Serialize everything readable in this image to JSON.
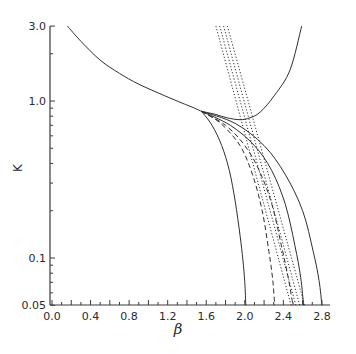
{
  "chart_data": {
    "type": "line",
    "title": "",
    "xlabel": "β",
    "ylabel": "K",
    "xlim": [
      0.0,
      2.9
    ],
    "ylim": [
      0.05,
      3.0
    ],
    "yscale": "log",
    "grid": false,
    "legend": null,
    "x_ticks": [
      "0.0",
      "0.4",
      "0.8",
      "1.2",
      "1.6",
      "2.0",
      "2.4",
      "2.8"
    ],
    "y_ticks": [
      "3.0",
      "1.0",
      "0.1",
      "0.05"
    ],
    "series": [
      {
        "name": "common-branch",
        "style": "solid",
        "x": [
          0.16,
          0.3,
          0.5,
          0.7,
          0.9,
          1.17,
          1.35,
          1.48,
          1.55
        ],
        "y": [
          3.0,
          2.4,
          1.82,
          1.5,
          1.28,
          1.08,
          0.97,
          0.9,
          0.86
        ]
      },
      {
        "name": "u-curve",
        "style": "solid",
        "x": [
          1.55,
          1.7,
          1.82,
          1.95,
          2.05,
          2.16,
          2.31,
          2.47,
          2.59
        ],
        "y": [
          0.86,
          0.82,
          0.78,
          0.76,
          0.78,
          0.85,
          1.09,
          1.58,
          3.0
        ]
      },
      {
        "name": "collapse-2.0",
        "style": "solid",
        "x": [
          1.55,
          1.66,
          1.76,
          1.84,
          1.9,
          1.95,
          1.98,
          2.0,
          2.01
        ],
        "y": [
          0.86,
          0.7,
          0.52,
          0.36,
          0.23,
          0.14,
          0.097,
          0.07,
          0.05
        ]
      },
      {
        "name": "dashed-2.3",
        "style": "dashed",
        "x": [
          1.55,
          1.75,
          1.95,
          2.08,
          2.18,
          2.25,
          2.29,
          2.31
        ],
        "y": [
          0.86,
          0.72,
          0.52,
          0.34,
          0.2,
          0.11,
          0.072,
          0.05
        ]
      },
      {
        "name": "dashed-2.5",
        "style": "dashed",
        "x": [
          1.55,
          1.8,
          2.0,
          2.15,
          2.28,
          2.38,
          2.45,
          2.5
        ],
        "y": [
          0.86,
          0.7,
          0.52,
          0.36,
          0.22,
          0.12,
          0.075,
          0.05
        ]
      },
      {
        "name": "solid-2.6",
        "style": "solid",
        "x": [
          1.55,
          1.85,
          2.1,
          2.28,
          2.42,
          2.52,
          2.58,
          2.61
        ],
        "y": [
          0.86,
          0.7,
          0.52,
          0.36,
          0.22,
          0.12,
          0.075,
          0.05
        ]
      },
      {
        "name": "solid-2.8",
        "style": "solid",
        "x": [
          1.55,
          1.9,
          2.2,
          2.42,
          2.6,
          2.71,
          2.77,
          2.8
        ],
        "y": [
          0.86,
          0.72,
          0.52,
          0.34,
          0.2,
          0.11,
          0.072,
          0.05
        ]
      },
      {
        "name": "dotted-1",
        "style": "dotted",
        "x": [
          1.7,
          2.48
        ],
        "y": [
          3.0,
          0.05
        ]
      },
      {
        "name": "dotted-2",
        "style": "dotted",
        "x": [
          1.74,
          2.53
        ],
        "y": [
          3.0,
          0.05
        ]
      },
      {
        "name": "dotted-3",
        "style": "dotted",
        "x": [
          1.78,
          2.57
        ],
        "y": [
          3.0,
          0.05
        ]
      },
      {
        "name": "dotted-4",
        "style": "dotted",
        "x": [
          1.82,
          2.62
        ],
        "y": [
          3.0,
          0.05
        ]
      }
    ]
  },
  "axes": {
    "x_label": "β",
    "y_label": "K"
  }
}
